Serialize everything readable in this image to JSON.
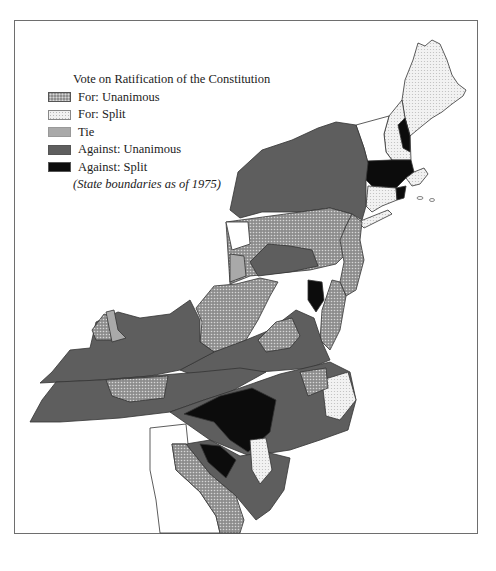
{
  "legend": {
    "title": "Vote on Ratification of the Constitution",
    "items": [
      {
        "label": "For: Unanimous",
        "pattern": "dark-dotted",
        "color": "#8f8f8f"
      },
      {
        "label": "For: Split",
        "pattern": "light-dotted",
        "color": "#f1f1f1"
      },
      {
        "label": "Tie",
        "pattern": "solid",
        "color": "#a9a9a9"
      },
      {
        "label": "Against: Unanimous",
        "pattern": "solid",
        "color": "#5e5e5e"
      },
      {
        "label": "Against: Split",
        "pattern": "solid",
        "color": "#0c0c0c"
      }
    ],
    "note": "(State boundaries as of 1975)"
  },
  "map": {
    "subject": "Eastern United States counties by vote on ratification of the Constitution",
    "regions": [
      {
        "name": "Maine",
        "vote": "For: Split"
      },
      {
        "name": "New Hampshire",
        "vote": "mixed"
      },
      {
        "name": "Vermont",
        "vote": "not shaded"
      },
      {
        "name": "Massachusetts",
        "vote": "mixed"
      },
      {
        "name": "Rhode Island",
        "vote": "Against: Split"
      },
      {
        "name": "Connecticut",
        "vote": "For: Split"
      },
      {
        "name": "New York",
        "vote": "Against: Unanimous"
      },
      {
        "name": "New Jersey",
        "vote": "For: Unanimous"
      },
      {
        "name": "Pennsylvania",
        "vote": "mixed"
      },
      {
        "name": "Delaware",
        "vote": "For: Unanimous"
      },
      {
        "name": "Maryland",
        "vote": "mixed"
      },
      {
        "name": "Virginia",
        "vote": "mixed"
      },
      {
        "name": "West Virginia",
        "vote": "For: Unanimous"
      },
      {
        "name": "Kentucky",
        "vote": "Against: Unanimous"
      },
      {
        "name": "Tennessee",
        "vote": "Against: Unanimous"
      },
      {
        "name": "North Carolina",
        "vote": "mixed"
      },
      {
        "name": "South Carolina",
        "vote": "mixed"
      },
      {
        "name": "Georgia",
        "vote": "For: Unanimous"
      }
    ]
  }
}
